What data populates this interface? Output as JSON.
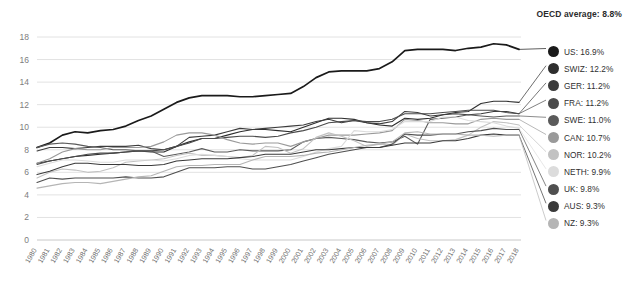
{
  "header": {
    "oecd_average_label": "OECD average: 8.8%"
  },
  "chart_data": {
    "type": "line",
    "title": "",
    "subtitle": "",
    "xlabel": "",
    "ylabel": "",
    "grid": true,
    "legend_position": "right",
    "ylim": [
      0,
      18
    ],
    "yticks": [
      0,
      2,
      4,
      6,
      8,
      10,
      12,
      14,
      16,
      18
    ],
    "annotations": [
      "OECD average: 8.8%"
    ],
    "x": [
      1980,
      1981,
      1982,
      1983,
      1984,
      1985,
      1986,
      1987,
      1988,
      1989,
      1990,
      1991,
      1992,
      1993,
      1994,
      1995,
      1996,
      1997,
      1998,
      1999,
      2000,
      2001,
      2002,
      2003,
      2004,
      2005,
      2006,
      2007,
      2008,
      2009,
      2010,
      2011,
      2012,
      2013,
      2014,
      2015,
      2016,
      2017,
      2018
    ],
    "series": [
      {
        "name": "US",
        "legend_label": "US: 16.9%",
        "color": "#1a1a1a",
        "final_value": 16.9,
        "values": [
          8.2,
          8.6,
          9.3,
          9.6,
          9.5,
          9.7,
          9.8,
          10.1,
          10.6,
          11.0,
          11.6,
          12.2,
          12.6,
          12.8,
          12.8,
          12.8,
          12.7,
          12.7,
          12.8,
          12.9,
          13.0,
          13.6,
          14.4,
          14.9,
          15.0,
          15.0,
          15.0,
          15.2,
          15.8,
          16.8,
          16.9,
          16.9,
          16.9,
          16.8,
          17.0,
          17.1,
          17.4,
          17.3,
          16.9
        ]
      },
      {
        "name": "SWIZ",
        "legend_label": "SWIZ: 12.2%",
        "color": "#2e2e2e",
        "final_value": 12.2,
        "values": [
          6.8,
          7.0,
          7.2,
          7.4,
          7.5,
          7.6,
          7.7,
          7.8,
          7.9,
          7.8,
          7.8,
          8.3,
          8.7,
          9.0,
          9.0,
          9.3,
          9.6,
          9.8,
          9.8,
          9.7,
          9.6,
          10.0,
          10.4,
          10.8,
          10.8,
          10.7,
          10.4,
          10.2,
          10.1,
          10.8,
          10.7,
          10.8,
          11.1,
          11.3,
          11.4,
          12.1,
          12.3,
          12.3,
          12.2
        ]
      },
      {
        "name": "GER",
        "legend_label": "GER: 11.2%",
        "color": "#3c3c3c",
        "final_value": 11.2,
        "values": [
          7.9,
          8.2,
          8.2,
          8.1,
          8.2,
          8.3,
          8.3,
          8.3,
          8.4,
          8.1,
          8.0,
          8.3,
          9.1,
          9.2,
          9.3,
          9.6,
          9.9,
          9.8,
          9.9,
          10.0,
          10.1,
          10.2,
          10.5,
          10.7,
          10.4,
          10.6,
          10.4,
          10.3,
          10.5,
          11.4,
          11.3,
          11.0,
          11.1,
          11.2,
          11.1,
          11.2,
          11.4,
          11.4,
          11.2
        ]
      },
      {
        "name": "FRA",
        "legend_label": "FRA: 11.2%",
        "color": "#4b4b4b",
        "final_value": 11.2,
        "values": [
          6.7,
          7.0,
          7.2,
          7.4,
          7.6,
          7.7,
          7.7,
          7.8,
          7.9,
          7.9,
          8.0,
          8.3,
          8.6,
          9.0,
          9.0,
          9.1,
          9.2,
          9.2,
          9.1,
          9.2,
          9.5,
          9.7,
          10.0,
          10.4,
          10.5,
          10.6,
          10.5,
          10.5,
          10.7,
          11.2,
          11.2,
          11.2,
          11.3,
          11.4,
          11.5,
          11.5,
          11.5,
          11.3,
          11.2
        ]
      },
      {
        "name": "SWE",
        "legend_label": "SWE: 11.0%",
        "color": "#5a5a5a",
        "final_value": 11.0,
        "values": [
          8.2,
          8.5,
          8.6,
          8.5,
          8.3,
          8.2,
          8.0,
          8.0,
          7.9,
          7.9,
          7.4,
          7.6,
          7.8,
          8.1,
          7.8,
          7.8,
          8.0,
          7.9,
          7.9,
          7.9,
          8.0,
          8.7,
          9.0,
          9.1,
          9.0,
          8.9,
          8.7,
          8.6,
          8.7,
          9.2,
          8.5,
          10.7,
          10.8,
          10.9,
          11.1,
          11.0,
          10.9,
          11.0,
          11.0
        ]
      },
      {
        "name": "CAN",
        "legend_label": "CAN: 10.7%",
        "color": "#9a9a9a",
        "final_value": 10.7,
        "values": [
          6.8,
          7.2,
          7.8,
          8.1,
          8.0,
          8.0,
          8.2,
          8.2,
          8.2,
          8.3,
          8.7,
          9.3,
          9.5,
          9.5,
          9.3,
          8.9,
          8.6,
          8.5,
          8.6,
          8.6,
          8.3,
          8.7,
          9.0,
          9.3,
          9.3,
          9.3,
          9.4,
          9.5,
          9.7,
          10.7,
          10.6,
          10.4,
          10.4,
          10.3,
          10.3,
          10.7,
          10.8,
          10.7,
          10.7
        ]
      },
      {
        "name": "NOR",
        "legend_label": "NOR: 10.2%",
        "color": "#c2c2c2",
        "final_value": 10.2,
        "values": [
          5.5,
          6.0,
          6.3,
          6.2,
          6.0,
          6.1,
          6.4,
          6.9,
          7.0,
          7.1,
          7.2,
          7.5,
          7.7,
          7.5,
          7.5,
          7.4,
          7.3,
          7.5,
          8.3,
          8.2,
          7.7,
          8.1,
          9.1,
          9.5,
          9.2,
          8.8,
          8.3,
          8.5,
          8.4,
          9.4,
          9.0,
          8.8,
          8.8,
          8.9,
          9.3,
          10.0,
          10.5,
          10.4,
          10.2
        ]
      },
      {
        "name": "NETH",
        "legend_label": "NETH: 9.9%",
        "color": "#dcdcdc",
        "final_value": 9.9,
        "values": [
          6.5,
          6.8,
          7.1,
          7.1,
          7.0,
          6.9,
          6.9,
          7.1,
          7.1,
          7.1,
          7.0,
          7.2,
          7.5,
          7.6,
          7.5,
          7.4,
          7.2,
          7.1,
          7.1,
          7.1,
          7.1,
          7.4,
          7.8,
          8.1,
          8.3,
          9.7,
          9.6,
          9.6,
          9.8,
          10.5,
          10.5,
          10.5,
          10.9,
          10.9,
          10.6,
          10.5,
          10.4,
          10.1,
          9.9
        ]
      },
      {
        "name": "UK",
        "legend_label": "UK: 9.8%",
        "color": "#4f4f4f",
        "final_value": 9.8,
        "values": [
          5.1,
          5.5,
          5.4,
          5.5,
          5.5,
          5.5,
          5.5,
          5.6,
          5.5,
          5.5,
          5.6,
          6.0,
          6.4,
          6.4,
          6.4,
          6.5,
          6.5,
          6.3,
          6.3,
          6.5,
          6.7,
          7.0,
          7.3,
          7.6,
          7.8,
          8.0,
          8.2,
          8.2,
          8.5,
          9.4,
          9.3,
          9.3,
          9.4,
          9.4,
          9.6,
          9.7,
          9.9,
          9.8,
          9.8
        ]
      },
      {
        "name": "AUS",
        "legend_label": "AUS: 9.3%",
        "color": "#3a3a3a",
        "final_value": 9.3,
        "values": [
          5.8,
          6.1,
          6.5,
          6.8,
          6.8,
          6.7,
          6.7,
          6.7,
          6.6,
          6.6,
          6.7,
          7.0,
          7.1,
          7.2,
          7.2,
          7.2,
          7.3,
          7.4,
          7.6,
          7.6,
          7.6,
          7.8,
          8.0,
          8.0,
          8.1,
          8.2,
          8.2,
          8.2,
          8.4,
          8.6,
          8.6,
          8.6,
          8.8,
          8.8,
          9.0,
          9.3,
          9.4,
          9.3,
          9.3
        ]
      },
      {
        "name": "NZ",
        "legend_label": "NZ: 9.3%",
        "color": "#b5b5b5",
        "final_value": 9.3,
        "values": [
          4.6,
          4.8,
          5.0,
          5.1,
          5.1,
          5.0,
          5.2,
          5.4,
          5.6,
          5.7,
          6.1,
          6.5,
          6.6,
          6.6,
          6.7,
          6.7,
          6.7,
          7.1,
          7.4,
          7.4,
          7.4,
          7.5,
          7.7,
          7.8,
          8.0,
          8.2,
          8.4,
          8.5,
          8.7,
          9.5,
          9.6,
          9.4,
          9.4,
          9.4,
          9.3,
          9.3,
          9.2,
          9.3,
          9.3
        ]
      }
    ]
  }
}
